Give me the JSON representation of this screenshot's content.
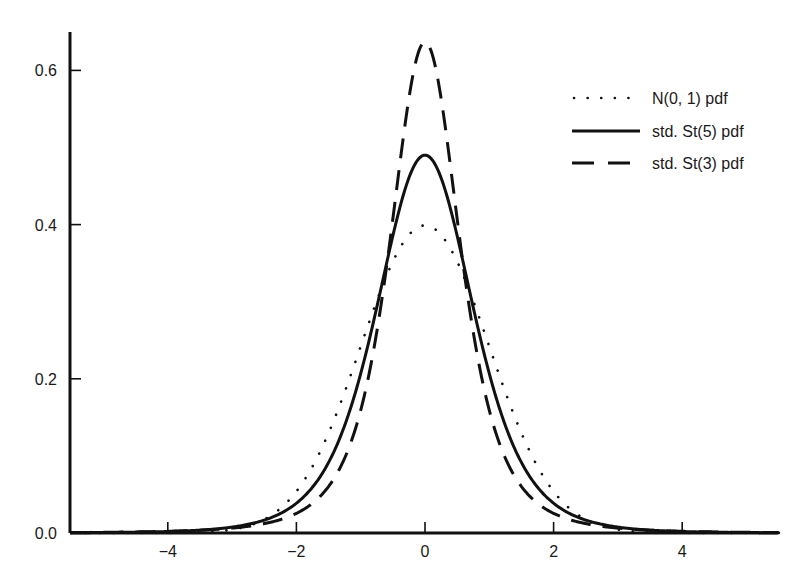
{
  "chart_data": {
    "type": "line",
    "title": "",
    "xlabel": "",
    "ylabel": "",
    "xlim": [
      -5.5,
      5.5
    ],
    "ylim": [
      0,
      0.66
    ],
    "grid": false,
    "legend_position": "upper right",
    "x_ticks": [
      -4,
      -2,
      0,
      2,
      4
    ],
    "x_tick_labels": [
      "−4",
      "−2",
      "0",
      "2",
      "4"
    ],
    "y_ticks": [
      0.0,
      0.2,
      0.4,
      0.6
    ],
    "y_tick_labels": [
      "0.0",
      "0.2",
      "0.4",
      "0.6"
    ],
    "x": [
      -5,
      -4.5,
      -4,
      -3.5,
      -3,
      -2.5,
      -2,
      -1.5,
      -1,
      -0.5,
      0,
      0.5,
      1,
      1.5,
      2,
      2.5,
      3,
      3.5,
      4,
      4.5,
      5
    ],
    "series": [
      {
        "name": "N(0, 1) pdf",
        "style": "dotted",
        "dist": "normal",
        "values": [
          1.5e-06,
          1.6e-05,
          0.000134,
          0.000873,
          0.00443,
          0.01753,
          0.05399,
          0.12952,
          0.24197,
          0.35207,
          0.39894,
          0.35207,
          0.24197,
          0.12952,
          0.05399,
          0.01753,
          0.00443,
          0.000873,
          0.000134,
          1.6e-05,
          1.5e-06
        ]
      },
      {
        "name": "std. St(5) pdf",
        "style": "solid",
        "dist": "std_t",
        "nu": 5,
        "values": [
          0.00034,
          0.00105,
          0.00121,
          0.00373,
          0.00557,
          0.0167,
          0.0347,
          0.0914,
          0.2237,
          0.3855,
          0.4901,
          0.3855,
          0.2237,
          0.0914,
          0.0347,
          0.0167,
          0.00557,
          0.00373,
          0.00121,
          0.00105,
          0.00034
        ]
      },
      {
        "name": "std. St(3) pdf",
        "style": "dashed",
        "dist": "std_t",
        "nu": 3,
        "values": [
          0.00094,
          0.00141,
          0.0022,
          0.00363,
          0.00637,
          0.0121,
          0.0255,
          0.0603,
          0.1592,
          0.4074,
          0.6366,
          0.4074,
          0.1592,
          0.0603,
          0.0255,
          0.0121,
          0.00637,
          0.00363,
          0.0022,
          0.00141,
          0.00094
        ]
      }
    ]
  },
  "legend": {
    "items": [
      {
        "label": "N(0, 1) pdf",
        "style": "dotted"
      },
      {
        "label": "std. St(5) pdf",
        "style": "solid"
      },
      {
        "label": "std. St(3) pdf",
        "style": "dashed"
      }
    ]
  },
  "colors": {
    "line": "#111111",
    "background": "#ffffff"
  }
}
